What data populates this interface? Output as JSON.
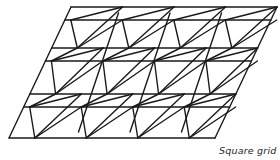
{
  "diagram": {
    "type": "double-layer space frame (oblique view)",
    "caption": "Square grid",
    "stroke_color": "#1a1a1a",
    "background": "#ffffff",
    "geometry": {
      "top_edge": {
        "y": 7,
        "x_start": 71,
        "x_end": 277
      },
      "bottom_edge": {
        "y": 138,
        "x_start": 9,
        "x_end": 214
      },
      "node_spacing": 51.4,
      "horizontal_lines_y": [
        7,
        20,
        48,
        61,
        94,
        107,
        138
      ],
      "rows_A_y": [
        7,
        48,
        94,
        138
      ],
      "rows_B_y": [
        20,
        61,
        107
      ]
    }
  }
}
